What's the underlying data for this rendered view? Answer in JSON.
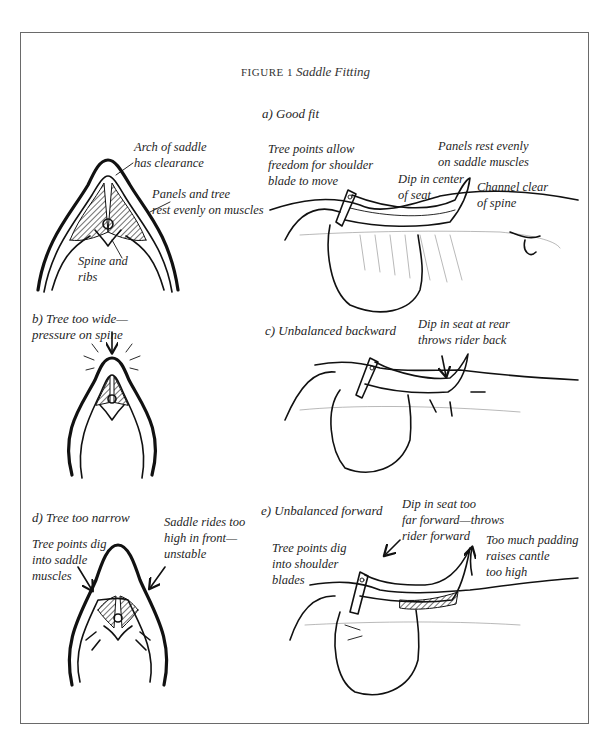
{
  "figure": {
    "number_label": "FIGURE 1",
    "title": "Saddle Fitting"
  },
  "panels": {
    "a": {
      "label": "a) Good fit",
      "front_view_callouts": [
        {
          "id": "arch",
          "line1": "Arch of saddle",
          "line2": "has clearance"
        },
        {
          "id": "panels-tree",
          "line1": "Panels and tree",
          "line2": "rest evenly on muscles"
        },
        {
          "id": "spine-ribs",
          "line1": "Spine and",
          "line2": "ribs"
        }
      ],
      "side_view_callouts": [
        {
          "id": "tree-points",
          "line1": "Tree points allow",
          "line2": "freedom for shoulder",
          "line3": "blade to move"
        },
        {
          "id": "panels-rest",
          "line1": "Panels rest evenly",
          "line2": "on saddle muscles"
        },
        {
          "id": "dip-center",
          "line1": "Dip in center",
          "line2": "of seat"
        },
        {
          "id": "channel-clear",
          "line1": "Channel clear",
          "line2": "of spine"
        }
      ]
    },
    "b": {
      "label_line1": "b) Tree too wide—",
      "label_line2": "pressure on spine"
    },
    "c": {
      "label": "c) Unbalanced backward",
      "callouts": [
        {
          "id": "dip-rear",
          "line1": "Dip in seat at rear",
          "line2": "throws rider back"
        }
      ]
    },
    "d": {
      "label": "d) Tree too narrow",
      "callouts": [
        {
          "id": "tree-points-dig",
          "line1": "Tree points dig",
          "line2": "into saddle",
          "line3": "muscles"
        },
        {
          "id": "rides-high",
          "line1": "Saddle rides too",
          "line2": "high in front—",
          "line3": "unstable"
        }
      ]
    },
    "e": {
      "label": "e) Unbalanced forward",
      "callouts": [
        {
          "id": "dip-forward",
          "line1": "Dip in seat too",
          "line2": "far forward—throws",
          "line3": "rider forward"
        },
        {
          "id": "tree-points-shoulder",
          "line1": "Tree points dig",
          "line2": "into shoulder",
          "line3": "blades"
        },
        {
          "id": "padding",
          "line1": "Too much padding",
          "line2": "raises cantle",
          "line3": "too high"
        }
      ]
    }
  }
}
